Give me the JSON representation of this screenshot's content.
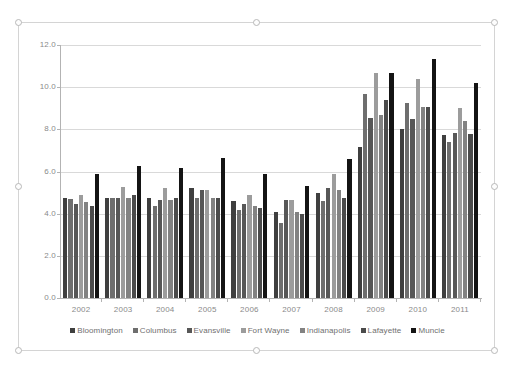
{
  "chart_object": {
    "selected": true,
    "handles": [
      "top-left",
      "top-center",
      "top-right",
      "middle-left",
      "middle-right",
      "bottom-left",
      "bottom-center",
      "bottom-right"
    ]
  },
  "chart_data": {
    "type": "bar",
    "title": "",
    "subtitle": "",
    "xlabel": "",
    "ylabel": "",
    "ylim": [
      0.0,
      12.0
    ],
    "ytick_values": [
      0.0,
      2.0,
      4.0,
      6.0,
      8.0,
      10.0,
      12.0
    ],
    "ytick_labels": [
      "0.0",
      "2.0",
      "4.0",
      "6.0",
      "8.0",
      "10.0",
      "12.0"
    ],
    "grid": true,
    "grid_axis": "y",
    "legend_position": "bottom",
    "categories": [
      "2002",
      "2003",
      "2004",
      "2005",
      "2006",
      "2007",
      "2008",
      "2009",
      "2010",
      "2011"
    ],
    "series": [
      {
        "name": "Bloomington",
        "color": "#3f3f3f",
        "values": [
          4.75,
          4.75,
          4.75,
          5.2,
          4.58,
          4.07,
          4.97,
          7.15,
          8.0,
          7.72
        ]
      },
      {
        "name": "Columbus",
        "color": "#6e6e6e",
        "values": [
          4.72,
          4.75,
          4.35,
          4.75,
          4.17,
          3.58,
          4.58,
          9.7,
          9.27,
          7.38
        ]
      },
      {
        "name": "Evansville",
        "color": "#575757",
        "values": [
          4.45,
          4.75,
          4.65,
          5.1,
          4.47,
          4.67,
          5.2,
          8.55,
          8.5,
          7.82
        ]
      },
      {
        "name": "Fort Wayne",
        "color": "#9c9c9c",
        "values": [
          4.87,
          5.27,
          5.2,
          5.1,
          4.88,
          4.65,
          5.88,
          10.67,
          10.37,
          9.0
        ]
      },
      {
        "name": "Indianapolis",
        "color": "#828282",
        "values": [
          4.55,
          4.75,
          4.65,
          4.75,
          4.35,
          4.07,
          5.12,
          8.68,
          9.08,
          8.4
        ]
      },
      {
        "name": "Lafayette",
        "color": "#4b4b4b",
        "values": [
          4.38,
          4.9,
          4.75,
          4.75,
          4.25,
          3.98,
          4.75,
          9.4,
          9.08,
          7.8
        ]
      },
      {
        "name": "Muncie",
        "color": "#141414",
        "values": [
          5.88,
          6.27,
          6.17,
          6.65,
          5.9,
          5.3,
          6.57,
          10.67,
          11.32,
          10.18
        ]
      }
    ]
  }
}
